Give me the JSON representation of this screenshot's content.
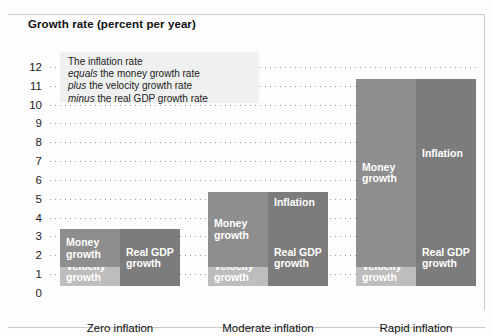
{
  "chart_data": {
    "type": "bar",
    "title": "Growth rate (percent per year)",
    "xlabel": "",
    "ylabel": "Growth rate (percent per year)",
    "ylim": [
      0,
      12
    ],
    "yticks": [
      0,
      1,
      2,
      3,
      4,
      5,
      6,
      7,
      8,
      9,
      10,
      11,
      12
    ],
    "grid": true,
    "legend": "none",
    "categories": [
      "Zero inflation",
      "Moderate inflation",
      "Rapid inflation"
    ],
    "note": "Each category shows two stacked columns: the left column (sources) is Money growth on top of Velocity growth; the right column (uses) is Inflation on top of Real GDP growth. Inflation = money growth + velocity growth - real GDP growth.",
    "groups": [
      {
        "label": "Zero inflation",
        "left_column": {
          "name": "sources",
          "segments": [
            {
              "label": "Money growth",
              "from": 1,
              "to": 3,
              "value": 2,
              "color": "#8e8e8e"
            },
            {
              "label": "Velocity growth",
              "from": 0,
              "to": 1,
              "value": 1,
              "color": "#bdbdbd"
            }
          ]
        },
        "right_column": {
          "name": "uses",
          "segments": [
            {
              "label": "Inflation",
              "from": 3,
              "to": 3,
              "value": 0,
              "color": "#7c7c7c"
            },
            {
              "label": "Real GDP growth",
              "from": 0,
              "to": 3,
              "value": 3,
              "color": "#7c7c7c"
            }
          ]
        }
      },
      {
        "label": "Moderate inflation",
        "left_column": {
          "name": "sources",
          "segments": [
            {
              "label": "Money growth",
              "from": 1,
              "to": 5,
              "value": 4,
              "color": "#8e8e8e"
            },
            {
              "label": "Velocity growth",
              "from": 0,
              "to": 1,
              "value": 1,
              "color": "#bdbdbd"
            }
          ]
        },
        "right_column": {
          "name": "uses",
          "segments": [
            {
              "label": "Inflation",
              "from": 3,
              "to": 5,
              "value": 2,
              "color": "#7c7c7c"
            },
            {
              "label": "Real GDP growth",
              "from": 0,
              "to": 3,
              "value": 3,
              "color": "#7c7c7c"
            }
          ]
        }
      },
      {
        "label": "Rapid inflation",
        "left_column": {
          "name": "sources",
          "segments": [
            {
              "label": "Money growth",
              "from": 1,
              "to": 11,
              "value": 10,
              "color": "#8e8e8e"
            },
            {
              "label": "Velocity growth",
              "from": 0,
              "to": 1,
              "value": 1,
              "color": "#bdbdbd"
            }
          ]
        },
        "right_column": {
          "name": "uses",
          "segments": [
            {
              "label": "Inflation",
              "from": 3,
              "to": 11,
              "value": 8,
              "color": "#7c7c7c"
            },
            {
              "label": "Real GDP growth",
              "from": 0,
              "to": 3,
              "value": 3,
              "color": "#7c7c7c"
            }
          ]
        }
      }
    ]
  },
  "annotation": {
    "line1": "The inflation rate",
    "line2_em": "equals",
    "line2": " the money growth rate",
    "line3_em": "plus",
    "line3": " the velocity growth rate",
    "line4_em": "minus",
    "line4": " the real GDP growth rate"
  },
  "colors": {
    "money": "#8e8e8e",
    "velocity": "#bdbdbd",
    "inflation": "#7c7c7c",
    "gdp": "#7c7c7c",
    "grid": "#9a9a9a",
    "note_bg": "#eff0f0"
  },
  "ticks": [
    "12",
    "11",
    "10",
    "9",
    "8",
    "7",
    "6",
    "5",
    "4",
    "3",
    "2",
    "1",
    "0"
  ]
}
